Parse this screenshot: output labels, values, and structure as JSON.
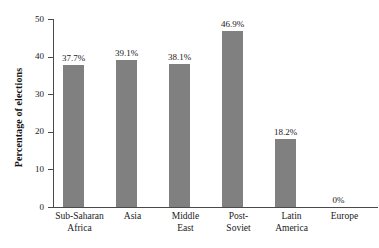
{
  "chart_data": {
    "type": "bar",
    "title": "",
    "subtitle": "",
    "xlabel": "",
    "ylabel": "Percentage of elections",
    "ylim": [
      0,
      50
    ],
    "yticks": [
      0,
      10,
      20,
      30,
      40,
      50
    ],
    "ytick_labels": [
      "0",
      "10",
      "20",
      "30",
      "40",
      "50"
    ],
    "grid": false,
    "legend": null,
    "bar_color": "#808080",
    "axis_color": "#4a4a4a",
    "background_color": "#ffffff",
    "categories": [
      "Sub-Saharan Africa",
      "Asia",
      "Middle East",
      "Post-Soviet",
      "Latin America",
      "Europe"
    ],
    "category_lines": [
      [
        "Sub-Saharan",
        "Africa"
      ],
      [
        "Asia",
        ""
      ],
      [
        "Middle",
        "East"
      ],
      [
        "Post-",
        "Soviet"
      ],
      [
        "Latin",
        "America"
      ],
      [
        "Europe",
        ""
      ]
    ],
    "values": [
      37.7,
      39.1,
      38.1,
      46.9,
      18.2,
      0
    ],
    "data_labels": [
      "37.7%",
      "39.1%",
      "38.1%",
      "46.9%",
      "18.2%",
      "0%"
    ]
  }
}
